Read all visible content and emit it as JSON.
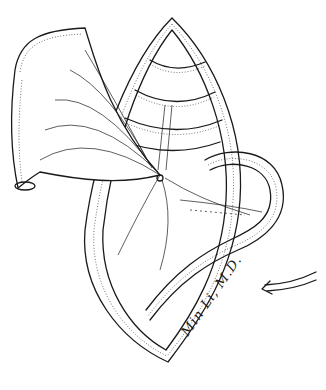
{
  "figure": {
    "type": "medical line illustration",
    "signature": "Min Li, M.D.",
    "arrow_direction": "left",
    "colors": {
      "ink": "#1a1a1a",
      "background": "#ffffff"
    }
  }
}
